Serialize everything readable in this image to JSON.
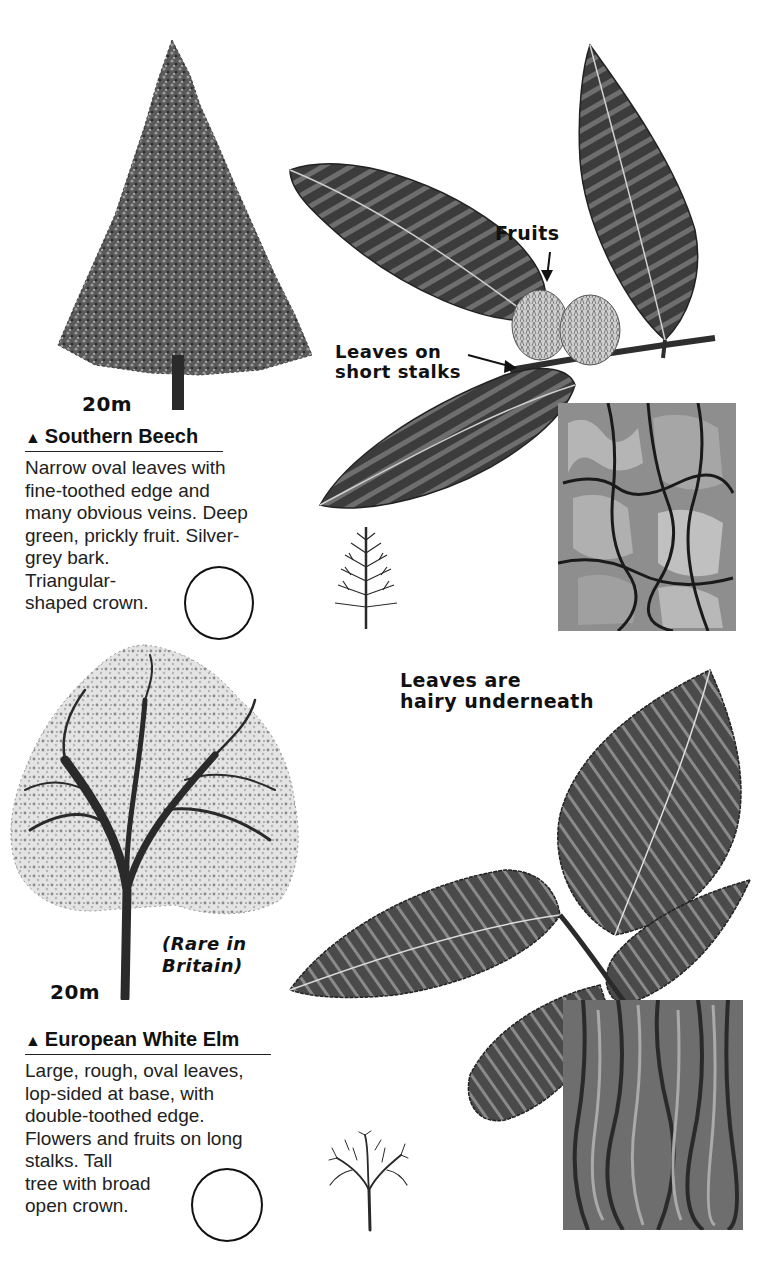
{
  "page": {
    "species": [
      {
        "id": "southern-beech",
        "name": "Southern Beech",
        "marker": "▲",
        "height_label": "20m",
        "description_lines": [
          "Narrow oval leaves with",
          "fine-toothed edge and",
          "many obvious veins. Deep",
          "green, prickly fruit. Silver-",
          "grey bark.",
          "Triangular-",
          "shaped crown."
        ],
        "annotations": {
          "fruits": "Fruits",
          "leaves_stalks_line1": "Leaves on",
          "leaves_stalks_line2": "short stalks"
        },
        "icons": {
          "tree": "conifer-shaped-tree-illustration",
          "leaf": "narrow-oval-leaf-illustration",
          "fruit": "prickly-fruit-illustration",
          "bark": "bark-texture-illustration",
          "silhouette": "winter-silhouette-triangular",
          "checkbox": "spotted-circle"
        }
      },
      {
        "id": "european-white-elm",
        "name": "European White Elm",
        "marker": "▲",
        "height_label": "20m",
        "rarity_note_line1": "(Rare in",
        "rarity_note_line2": "Britain)",
        "description_lines": [
          "Large, rough, oval leaves,",
          "lop-sided at base, with",
          "double-toothed edge.",
          "Flowers and fruits on long",
          "stalks. Tall",
          "tree with broad",
          "open crown."
        ],
        "annotations": {
          "hairy_line1": "Leaves are",
          "hairy_line2": "hairy underneath"
        },
        "icons": {
          "tree": "broad-crown-tree-illustration",
          "leaf": "serrated-elm-leaf-illustration",
          "bark": "bark-texture-illustration",
          "silhouette": "winter-silhouette-broad",
          "checkbox": "spotted-circle"
        }
      }
    ],
    "colors": {
      "ink": "#111111",
      "leaf_dark": "#3a3a3a",
      "leaf_mid": "#6b6b6b",
      "bark_light": "#9a9a9a",
      "paper": "#ffffff"
    }
  }
}
